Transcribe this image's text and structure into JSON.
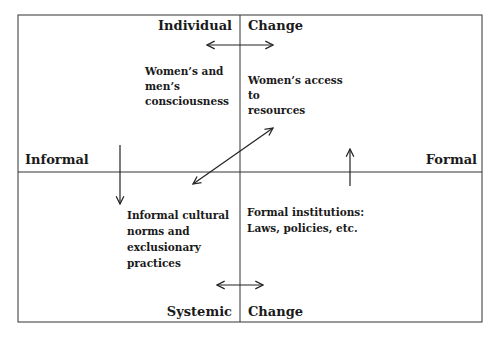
{
  "diagram": {
    "axes": {
      "top_left": "Individual",
      "top_right": "Change",
      "bottom_left": "Systemic",
      "bottom_right": "Change",
      "left": "Informal",
      "right": "Formal"
    },
    "quadrants": {
      "top_left": [
        "Women’s and",
        "men’s",
        "consciousness"
      ],
      "top_right": [
        "Women’s access",
        "to",
        "resources"
      ],
      "bottom_left": [
        "Informal cultural",
        "norms and",
        "exclusionary",
        "practices"
      ],
      "bottom_right": [
        "Formal institutions:",
        "Laws, policies, etc."
      ]
    },
    "arrows": [
      {
        "name": "individual-change-arrow",
        "type": "double-horizontal"
      },
      {
        "name": "systemic-change-arrow",
        "type": "double-horizontal"
      },
      {
        "name": "informal-down-arrow",
        "type": "down"
      },
      {
        "name": "formal-up-arrow",
        "type": "up"
      },
      {
        "name": "diagonal-arrow",
        "type": "double-diagonal"
      }
    ],
    "line_color": "#333333"
  }
}
